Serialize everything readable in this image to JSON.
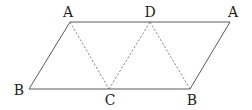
{
  "diagram": {
    "type": "geometry-figure",
    "points": {
      "A1": {
        "label": "A",
        "x": 70,
        "y": 22,
        "label_x": 68,
        "label_y": 15
      },
      "D": {
        "label": "D",
        "x": 150,
        "y": 22,
        "label_x": 150,
        "label_y": 15
      },
      "A2": {
        "label": "A",
        "x": 230,
        "y": 22,
        "label_x": 233,
        "label_y": 15
      },
      "B1": {
        "label": "B",
        "x": 29,
        "y": 89,
        "label_x": 19,
        "label_y": 94
      },
      "C": {
        "label": "C",
        "x": 109,
        "y": 89,
        "label_x": 110,
        "label_y": 105
      },
      "B2": {
        "label": "B",
        "x": 190,
        "y": 89,
        "label_x": 192,
        "label_y": 105
      }
    },
    "solid_edges": [
      [
        "B1",
        "A1"
      ],
      [
        "A1",
        "A2"
      ],
      [
        "A2",
        "B2"
      ],
      [
        "B2",
        "B1"
      ]
    ],
    "dashed_edges": [
      [
        "A1",
        "C"
      ],
      [
        "C",
        "D"
      ],
      [
        "D",
        "B2"
      ]
    ],
    "colors": {
      "solid": "#5a5a5a",
      "dashed": "#6a6a6a",
      "label": "#222222"
    }
  }
}
